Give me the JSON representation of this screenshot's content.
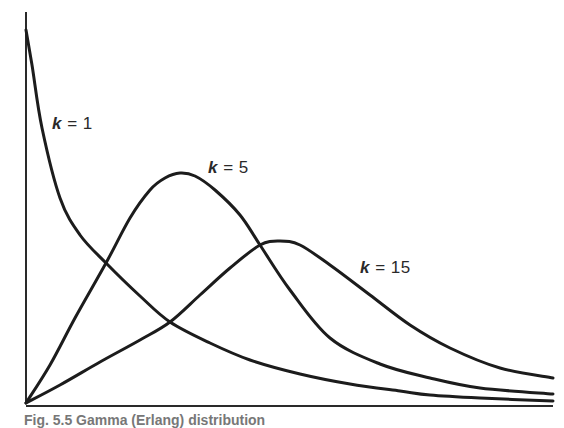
{
  "chart_data": {
    "type": "line",
    "title": "",
    "xlabel": "",
    "ylabel": "",
    "grid": false,
    "legend": "inline labels",
    "axis_pixels": {
      "origin": [
        26,
        403
      ],
      "x_end": 553,
      "y_top": 12
    },
    "series": [
      {
        "name": "k = 1",
        "k": 1,
        "label_text": "= 1",
        "label_pos": [
          52,
          114
        ],
        "points": [
          [
            26,
            30
          ],
          [
            32,
            65
          ],
          [
            42,
            128
          ],
          [
            60,
            198
          ],
          [
            80,
            235
          ],
          [
            106,
            263
          ],
          [
            140,
            296
          ],
          [
            170,
            322
          ],
          [
            210,
            343
          ],
          [
            250,
            360
          ],
          [
            300,
            374
          ],
          [
            350,
            384
          ],
          [
            400,
            391
          ],
          [
            430,
            395
          ],
          [
            480,
            398
          ],
          [
            553,
            401
          ]
        ]
      },
      {
        "name": "k = 5",
        "k": 5,
        "label_text": "= 5",
        "label_pos": [
          208,
          158
        ],
        "points": [
          [
            26,
            403
          ],
          [
            50,
            365
          ],
          [
            75,
            318
          ],
          [
            106,
            263
          ],
          [
            130,
            218
          ],
          [
            150,
            190
          ],
          [
            165,
            178
          ],
          [
            180,
            173
          ],
          [
            195,
            176
          ],
          [
            215,
            190
          ],
          [
            240,
            215
          ],
          [
            260,
            245
          ],
          [
            290,
            290
          ],
          [
            330,
            338
          ],
          [
            380,
            364
          ],
          [
            430,
            378
          ],
          [
            480,
            388
          ],
          [
            553,
            394
          ]
        ]
      },
      {
        "name": "k = 15",
        "k": 15,
        "label_text": "= 15",
        "label_pos": [
          360,
          258
        ],
        "points": [
          [
            26,
            403
          ],
          [
            60,
            385
          ],
          [
            100,
            362
          ],
          [
            140,
            340
          ],
          [
            170,
            322
          ],
          [
            200,
            295
          ],
          [
            230,
            268
          ],
          [
            260,
            245
          ],
          [
            280,
            241
          ],
          [
            300,
            245
          ],
          [
            330,
            265
          ],
          [
            370,
            295
          ],
          [
            410,
            325
          ],
          [
            450,
            348
          ],
          [
            500,
            368
          ],
          [
            553,
            378
          ]
        ]
      }
    ]
  },
  "labels": {
    "k_symbol": "k",
    "k1": "= 1",
    "k5": "= 5",
    "k15": "= 15"
  },
  "caption": "Fig. 5.5   Gamma (Erlang) distribution"
}
